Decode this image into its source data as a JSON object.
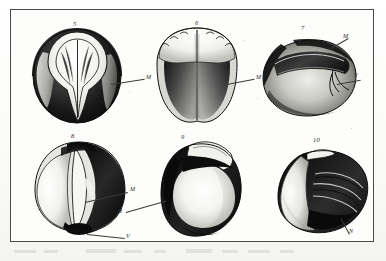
{
  "plate": {
    "type": "engraved-illustration-plate",
    "medium": "stipple / line engraving, monochrome scan",
    "subject": "seed and grain specimens, multiple views",
    "frame": {
      "border_color": "#4a4a4a",
      "background": "#fdfdfb"
    },
    "page_background": "#fcfcfa",
    "ink_color": "#1c1c1c"
  },
  "figures": [
    {
      "id": "fig-5",
      "number": "5",
      "view": "ventral view with deep median furrow and raised embryo ridge",
      "callouts": [
        {
          "letter": "M",
          "target": "median furrow / hilar groove"
        }
      ]
    },
    {
      "id": "fig-6",
      "number": "6",
      "view": "dorsal view, bilobed with crenate apex and median suture",
      "callouts": [
        {
          "letter": "M",
          "target": "median suture"
        }
      ]
    },
    {
      "id": "fig-7",
      "number": "7",
      "view": "lateral view, reniform outline with curved dorsal ridge",
      "callouts": [
        {
          "letter": "M",
          "target": "dorsal ridge"
        },
        {
          "letter": "V",
          "target": "hilum / micropylar region"
        }
      ]
    },
    {
      "id": "fig-8",
      "number": "8",
      "view": "oblique view showing overlapping cotyledon margin",
      "callouts": [
        {
          "letter": "M",
          "target": "cotyledon margin"
        },
        {
          "letter": "V",
          "target": "basal hilum"
        }
      ]
    },
    {
      "id": "fig-9",
      "number": "9",
      "view": "three-quarter view with convex body and recurved apical lobe",
      "callouts": [
        {
          "letter": "M",
          "target": "lateral ridge"
        }
      ]
    },
    {
      "id": "fig-10",
      "number": "10",
      "view": "apical view, folded and split showing inner surface",
      "callouts": [
        {
          "letter": "N",
          "target": "fold / inner face"
        }
      ]
    }
  ]
}
